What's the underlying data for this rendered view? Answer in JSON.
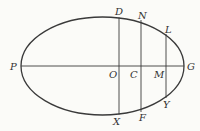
{
  "diagram": {
    "type": "ellipse-geometry",
    "ellipse": {
      "cx": 102.5,
      "cy": 66,
      "rx": 81.5,
      "ry": 49
    },
    "major_axis": {
      "from": "P",
      "to": "G"
    },
    "chords": [
      {
        "name": "DX",
        "through": "O",
        "top": "D",
        "bottom": "X"
      },
      {
        "name": "NF",
        "through": "C",
        "top": "N",
        "bottom": "F"
      },
      {
        "name": "LY",
        "through": "M",
        "top": "L",
        "bottom": "Y"
      }
    ],
    "labels": {
      "P": "P",
      "G": "G",
      "O": "O",
      "C": "C",
      "M": "M",
      "D": "D",
      "N": "N",
      "L": "L",
      "X": "X",
      "F": "F",
      "Y": "Y"
    },
    "colors": {
      "stroke": "#3a3a3a",
      "text": "#333333",
      "background": "#fbfbf8"
    }
  }
}
